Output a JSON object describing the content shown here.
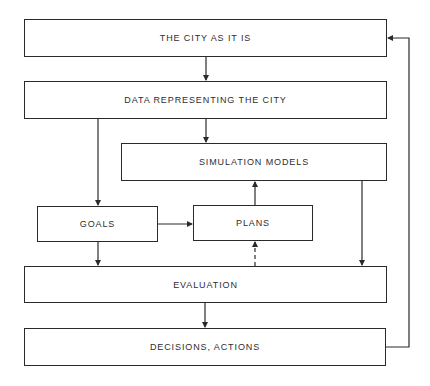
{
  "diagram": {
    "type": "flowchart",
    "nodes": [
      {
        "id": "city",
        "label": "THE CITY AS IT IS"
      },
      {
        "id": "data",
        "label": "DATA REPRESENTING THE CITY"
      },
      {
        "id": "sim",
        "label": "SIMULATION MODELS"
      },
      {
        "id": "goals",
        "label": "GOALS"
      },
      {
        "id": "plans",
        "label": "PLANS"
      },
      {
        "id": "eval",
        "label": "EVALUATION"
      },
      {
        "id": "decisions",
        "label": "DECISIONS, ACTIONS"
      }
    ],
    "edges": [
      {
        "from": "city",
        "to": "data",
        "style": "solid"
      },
      {
        "from": "data",
        "to": "sim",
        "style": "solid"
      },
      {
        "from": "data",
        "to": "goals",
        "style": "solid"
      },
      {
        "from": "goals",
        "to": "plans",
        "style": "solid"
      },
      {
        "from": "plans",
        "to": "sim",
        "style": "solid"
      },
      {
        "from": "goals",
        "to": "eval",
        "style": "solid"
      },
      {
        "from": "sim",
        "to": "eval",
        "style": "solid"
      },
      {
        "from": "eval",
        "to": "plans",
        "style": "dashed"
      },
      {
        "from": "eval",
        "to": "decisions",
        "style": "solid"
      },
      {
        "from": "decisions",
        "to": "city",
        "style": "solid"
      }
    ],
    "colors": {
      "line": "#2a2a2a",
      "text": "#2e2e2e",
      "background": "#ffffff"
    }
  }
}
